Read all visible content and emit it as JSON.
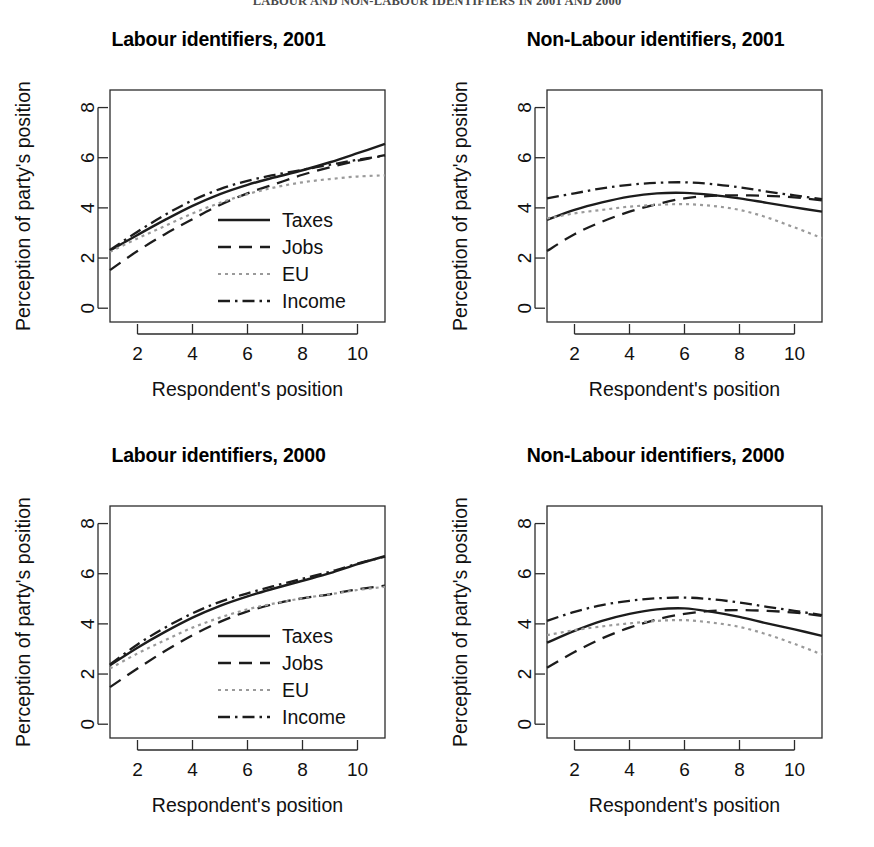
{
  "figure": {
    "caption": "LABOUR AND NON-LABOUR IDENTIFIERS IN 2001 AND 2000"
  },
  "axes": {
    "xlabel": "Respondent's position",
    "ylabel": "Perception of party's position",
    "xticks": [
      "2",
      "4",
      "6",
      "8",
      "10"
    ],
    "yticks": [
      "0",
      "2",
      "4",
      "6",
      "8"
    ]
  },
  "legend": {
    "taxes": "Taxes",
    "jobs": "Jobs",
    "eu": "EU",
    "income": "Income"
  },
  "panels": [
    {
      "key": "labour-2001",
      "title": "Labour identifiers, 2001",
      "has_legend": true
    },
    {
      "key": "non-labour-2001",
      "title": "Non-Labour identifiers, 2001",
      "has_legend": false
    },
    {
      "key": "labour-2000",
      "title": "Labour identifiers, 2000",
      "has_legend": true
    },
    {
      "key": "non-labour-2000",
      "title": "Non-Labour identifiers, 2000",
      "has_legend": false
    }
  ],
  "chart_data": [
    {
      "type": "line",
      "title": "Labour identifiers, 2001",
      "xlabel": "Respondent's position",
      "ylabel": "Perception of party's position",
      "xlim": [
        1,
        11
      ],
      "ylim": [
        -0.55,
        8.7
      ],
      "xticks": [
        2,
        4,
        6,
        8,
        10
      ],
      "yticks": [
        0,
        2,
        4,
        6,
        8
      ],
      "grid": false,
      "legend": "inside-lower-right",
      "x": [
        1,
        2,
        3,
        4,
        5,
        6,
        7,
        8,
        9,
        10,
        11
      ],
      "series": [
        {
          "name": "Taxes",
          "style": "solid",
          "values": [
            2.3,
            2.92,
            3.52,
            4.08,
            4.55,
            4.92,
            5.22,
            5.5,
            5.82,
            6.18,
            6.55
          ]
        },
        {
          "name": "Jobs",
          "style": "dashed",
          "values": [
            1.52,
            2.28,
            2.95,
            3.55,
            4.12,
            4.58,
            4.95,
            5.32,
            5.62,
            5.88,
            6.1
          ]
        },
        {
          "name": "EU",
          "style": "dotted",
          "values": [
            2.25,
            2.78,
            3.28,
            3.78,
            4.2,
            4.55,
            4.82,
            5.02,
            5.15,
            5.25,
            5.3
          ]
        },
        {
          "name": "Income",
          "style": "dashdot",
          "values": [
            2.32,
            3.05,
            3.72,
            4.3,
            4.75,
            5.08,
            5.32,
            5.52,
            5.72,
            5.92,
            6.08
          ]
        }
      ]
    },
    {
      "type": "line",
      "title": "Non-Labour identifiers, 2001",
      "xlabel": "Respondent's position",
      "ylabel": "Perception of party's position",
      "xlim": [
        1,
        11
      ],
      "ylim": [
        -0.55,
        8.7
      ],
      "xticks": [
        2,
        4,
        6,
        8,
        10
      ],
      "yticks": [
        0,
        2,
        4,
        6,
        8
      ],
      "grid": false,
      "legend": "none",
      "x": [
        1,
        2,
        3,
        4,
        5,
        6,
        7,
        8,
        9,
        10,
        11
      ],
      "series": [
        {
          "name": "Taxes",
          "style": "solid",
          "values": [
            3.52,
            3.92,
            4.22,
            4.45,
            4.58,
            4.6,
            4.52,
            4.38,
            4.2,
            4.02,
            3.85
          ]
        },
        {
          "name": "Jobs",
          "style": "dashed",
          "values": [
            2.28,
            2.95,
            3.45,
            3.85,
            4.15,
            4.38,
            4.48,
            4.5,
            4.48,
            4.42,
            4.3
          ]
        },
        {
          "name": "EU",
          "style": "dotted",
          "values": [
            3.58,
            3.78,
            3.92,
            4.05,
            4.12,
            4.15,
            4.08,
            3.92,
            3.62,
            3.22,
            2.8
          ]
        },
        {
          "name": "Income",
          "style": "dashdot",
          "values": [
            4.38,
            4.58,
            4.78,
            4.92,
            5.0,
            5.02,
            4.95,
            4.82,
            4.65,
            4.5,
            4.35
          ]
        }
      ]
    },
    {
      "type": "line",
      "title": "Labour identifiers, 2000",
      "xlabel": "Respondent's position",
      "ylabel": "Perception of party's position",
      "xlim": [
        1,
        11
      ],
      "ylim": [
        -0.55,
        8.7
      ],
      "xticks": [
        2,
        4,
        6,
        8,
        10
      ],
      "yticks": [
        0,
        2,
        4,
        6,
        8
      ],
      "grid": false,
      "legend": "inside-lower-right",
      "x": [
        1,
        2,
        3,
        4,
        5,
        6,
        7,
        8,
        9,
        10,
        11
      ],
      "series": [
        {
          "name": "Taxes",
          "style": "solid",
          "values": [
            2.35,
            3.05,
            3.68,
            4.25,
            4.72,
            5.1,
            5.42,
            5.72,
            6.02,
            6.38,
            6.7
          ]
        },
        {
          "name": "Jobs",
          "style": "dashed",
          "values": [
            1.48,
            2.22,
            2.92,
            3.55,
            4.08,
            4.5,
            4.8,
            5.02,
            5.18,
            5.38,
            5.52
          ]
        },
        {
          "name": "EU",
          "style": "dotted",
          "values": [
            2.22,
            2.82,
            3.35,
            3.85,
            4.25,
            4.58,
            4.82,
            5.02,
            5.18,
            5.35,
            5.48
          ]
        },
        {
          "name": "Income",
          "style": "dashdot",
          "values": [
            2.38,
            3.18,
            3.85,
            4.42,
            4.88,
            5.22,
            5.52,
            5.8,
            6.08,
            6.4,
            6.68
          ]
        }
      ]
    },
    {
      "type": "line",
      "title": "Non-Labour identifiers, 2000",
      "xlabel": "Respondent's position",
      "ylabel": "Perception of party's position",
      "xlim": [
        1,
        11
      ],
      "ylim": [
        -0.55,
        8.7
      ],
      "xticks": [
        2,
        4,
        6,
        8,
        10
      ],
      "yticks": [
        0,
        2,
        4,
        6,
        8
      ],
      "grid": false,
      "legend": "none",
      "x": [
        1,
        2,
        3,
        4,
        5,
        6,
        7,
        8,
        9,
        10,
        11
      ],
      "series": [
        {
          "name": "Taxes",
          "style": "solid",
          "values": [
            3.25,
            3.72,
            4.12,
            4.4,
            4.58,
            4.62,
            4.48,
            4.28,
            4.02,
            3.78,
            3.52
          ]
        },
        {
          "name": "Jobs",
          "style": "dashed",
          "values": [
            2.25,
            2.88,
            3.42,
            3.85,
            4.18,
            4.4,
            4.52,
            4.55,
            4.52,
            4.45,
            4.32
          ]
        },
        {
          "name": "EU",
          "style": "dotted",
          "values": [
            3.55,
            3.75,
            3.9,
            4.02,
            4.12,
            4.15,
            4.05,
            3.88,
            3.58,
            3.2,
            2.78
          ]
        },
        {
          "name": "Income",
          "style": "dashdot",
          "values": [
            4.12,
            4.48,
            4.75,
            4.92,
            5.02,
            5.05,
            4.98,
            4.85,
            4.68,
            4.52,
            4.35
          ]
        }
      ]
    }
  ]
}
